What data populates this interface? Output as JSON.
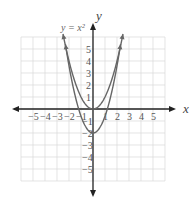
{
  "chart_data": {
    "type": "line",
    "title": "",
    "xlabel": "x",
    "ylabel": "y",
    "xlim": [
      -6,
      6
    ],
    "ylim": [
      -6,
      6
    ],
    "grid": true,
    "x_ticks": [
      "-5",
      "-4",
      "-3",
      "-2",
      "-1",
      "1",
      "2",
      "3",
      "4",
      "5"
    ],
    "y_ticks": [
      "5",
      "4",
      "3",
      "2",
      "1",
      "-1",
      "-2",
      "-3",
      "-4",
      "-5"
    ],
    "series": [
      {
        "name": "y = x²",
        "label": "y = x²",
        "expression": "x^2",
        "vertex": [
          0,
          0
        ],
        "points": [
          [
            -2.5,
            6.25
          ],
          [
            -2,
            4
          ],
          [
            -1,
            1
          ],
          [
            0,
            0
          ],
          [
            1,
            1
          ],
          [
            2,
            4
          ],
          [
            2.5,
            6.25
          ]
        ]
      },
      {
        "name": "",
        "label": "",
        "expression": null,
        "vertex": [
          0,
          -2
        ],
        "note": "Unlabeled parabola, vertex (0,-2), crosses x-axis near ±1.2; exact function not determinable from pixels",
        "points": []
      }
    ],
    "colors": {
      "curve": "#666666",
      "axis": "#222222",
      "grid": "#d8d8d8",
      "text": "#555555"
    }
  },
  "labels": {
    "x_axis": "x",
    "y_axis": "y",
    "curve1": "y = x²"
  }
}
